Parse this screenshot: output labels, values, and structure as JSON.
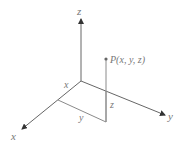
{
  "diagram": {
    "type": "3d-coordinate-system",
    "axes": {
      "x_label": "x",
      "y_label": "y",
      "z_label": "z"
    },
    "point": {
      "label": "P(x, y, z)"
    },
    "projections": {
      "x_label": "x",
      "y_label": "y",
      "z_label": "z"
    },
    "colors": {
      "axis": "#555555",
      "projection": "#8a8a8a",
      "text": "#777777"
    }
  }
}
